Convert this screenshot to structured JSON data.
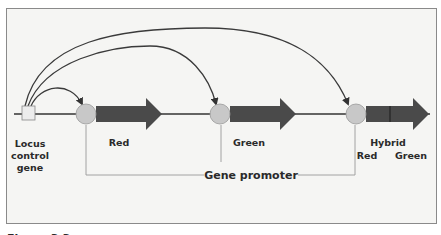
{
  "figure": {
    "caption": "Figure 3.3",
    "colors": {
      "frame_bg": "#f5f5f3",
      "frame_border": "#8a8a8a",
      "gene_arrow": "#4a4a4a",
      "promoter_fill": "#c8c8c8",
      "locus_fill": "#ececec",
      "line": "#333333",
      "bracket": "#9a9a9a"
    }
  },
  "labels": {
    "locus": [
      "Locus",
      "control",
      "gene"
    ],
    "gene1": "Red",
    "gene2": "Green",
    "hybrid_title": "Hybrid",
    "hybrid_red": "Red",
    "hybrid_green": "Green",
    "promoter": "Gene promoter"
  }
}
